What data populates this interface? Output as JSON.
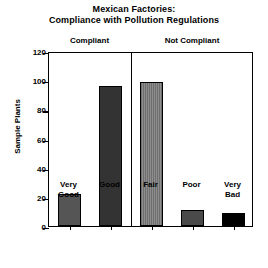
{
  "chart_data": {
    "type": "bar",
    "title": "Mexican Factories: Compliance with Pollution Regulations",
    "title_lines": [
      "Mexican Factories:",
      "Compliance with Pollution Regulations"
    ],
    "xlabel": "",
    "ylabel": "Sample Plants",
    "ylim": [
      0,
      120
    ],
    "ytick_values": [
      0,
      20,
      40,
      60,
      80,
      100,
      120
    ],
    "ytick_labels": [
      "0",
      "20",
      "40",
      "60",
      "80",
      "100",
      "120"
    ],
    "grid": false,
    "legend": "none",
    "categories": [
      "Very Good",
      "Good",
      "Fair",
      "Poor",
      "Very Bad"
    ],
    "category_lines": [
      [
        "Very",
        "Good"
      ],
      [
        "Good",
        ""
      ],
      [
        "Fair",
        ""
      ],
      [
        "Poor",
        ""
      ],
      [
        "Very",
        "Bad"
      ]
    ],
    "values": [
      22,
      96,
      99,
      11,
      9
    ],
    "bar_colors": [
      "#555555",
      "#333333",
      "#6e6e6e",
      "#4a4a4a",
      "#000000"
    ],
    "bar_patterns": [
      "solid",
      "solid",
      "vertical-stripes",
      "solid",
      "solid"
    ],
    "groups": [
      {
        "label": "Compliant",
        "categories": [
          "Very Good",
          "Good"
        ]
      },
      {
        "label": "Not Compliant",
        "categories": [
          "Fair",
          "Poor",
          "Very Bad"
        ]
      }
    ],
    "group_divider_after_category": "Good"
  },
  "colors": {
    "axis": "#000000",
    "background": "#ffffff",
    "text": "#000000"
  }
}
